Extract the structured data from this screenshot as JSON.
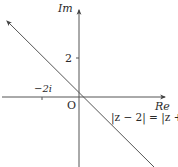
{
  "diagram": {
    "type": "argand-diagram",
    "axes": {
      "imaginary_label": "Im",
      "real_label": "Re",
      "origin_label": "O"
    },
    "ticks": {
      "imaginary_tick_label": "2",
      "real_tick_label": "−2i"
    },
    "locus": {
      "equation": "|z − 2| = |z + 2i|",
      "description": "line y = −x through origin"
    },
    "colors": {
      "line": "#555555",
      "text": "#2a2a2a",
      "background": "#ffffff"
    }
  }
}
